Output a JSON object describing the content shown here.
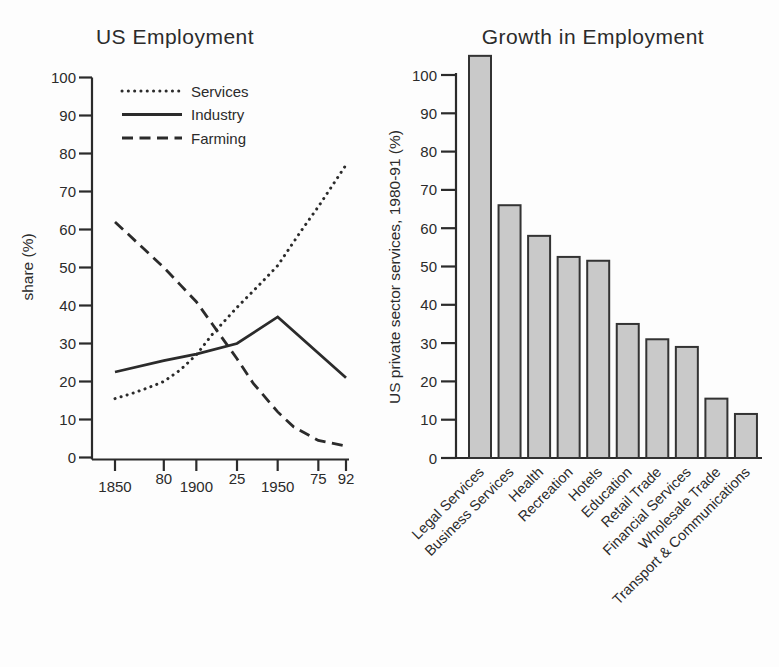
{
  "figure": {
    "background": "#fdfdfd",
    "ink": "#2b2b2b",
    "description_left_title": "US Employment",
    "description_right_title": "Growth in Employment"
  },
  "chart_data": [
    {
      "type": "line",
      "title": "US Employment",
      "xlabel": "",
      "ylabel": "share (%)",
      "ylim": [
        0,
        100
      ],
      "yticks": [
        0,
        10,
        20,
        30,
        40,
        50,
        60,
        70,
        80,
        90,
        100
      ],
      "xlim": [
        1850,
        1992
      ],
      "xticks": [
        {
          "year": 1850,
          "label": "1850",
          "row": "low"
        },
        {
          "year": 1880,
          "label": "80",
          "row": "high"
        },
        {
          "year": 1900,
          "label": "1900",
          "row": "low"
        },
        {
          "year": 1925,
          "label": "25",
          "row": "high"
        },
        {
          "year": 1950,
          "label": "1950",
          "row": "low"
        },
        {
          "year": 1975,
          "label": "75",
          "row": "high"
        },
        {
          "year": 1992,
          "label": "92",
          "row": "high"
        }
      ],
      "grid": false,
      "legend": {
        "position": "top-left",
        "entries": [
          "Services",
          "Industry",
          "Farming"
        ]
      },
      "series": [
        {
          "name": "Services",
          "line_style": "dotted",
          "points": [
            [
              1850,
              15.5
            ],
            [
              1860,
              16.8
            ],
            [
              1870,
              18.3
            ],
            [
              1880,
              20
            ],
            [
              1890,
              23
            ],
            [
              1900,
              27
            ],
            [
              1910,
              32.5
            ],
            [
              1925,
              39.5
            ],
            [
              1940,
              46
            ],
            [
              1950,
              50.5
            ],
            [
              1965,
              60
            ],
            [
              1975,
              66
            ],
            [
              1992,
              77
            ]
          ]
        },
        {
          "name": "Industry",
          "line_style": "solid",
          "points": [
            [
              1850,
              22.5
            ],
            [
              1880,
              25.5
            ],
            [
              1900,
              27.2
            ],
            [
              1925,
              30
            ],
            [
              1950,
              37
            ],
            [
              1992,
              21
            ]
          ]
        },
        {
          "name": "Farming",
          "line_style": "dashed",
          "points": [
            [
              1850,
              62
            ],
            [
              1865,
              56
            ],
            [
              1880,
              50
            ],
            [
              1890,
              45.5
            ],
            [
              1900,
              41
            ],
            [
              1910,
              35
            ],
            [
              1925,
              26
            ],
            [
              1935,
              19.5
            ],
            [
              1950,
              12
            ],
            [
              1960,
              8
            ],
            [
              1975,
              4.5
            ],
            [
              1992,
              3
            ]
          ]
        }
      ]
    },
    {
      "type": "bar",
      "title": "Growth in Employment",
      "xlabel": "",
      "ylabel": "US private sector services, 1980-91 (%)",
      "ylim": [
        0,
        100
      ],
      "yticks": [
        0,
        10,
        20,
        30,
        40,
        50,
        60,
        70,
        80,
        90,
        100
      ],
      "grid": false,
      "categories": [
        "Legal Services",
        "Business Services",
        "Health",
        "Recreation",
        "Hotels",
        "Education",
        "Retail Trade",
        "Financial Services",
        "Wholesale Trade",
        "Transport & Communications"
      ],
      "values": [
        105,
        66,
        58,
        52.5,
        51.5,
        35,
        31,
        29,
        15.5,
        11.5
      ],
      "bar_fill": "#c9c9c9",
      "bar_stroke": "#333333"
    }
  ]
}
